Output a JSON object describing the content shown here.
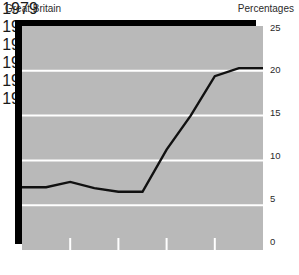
{
  "header": {
    "region_label": "Great Britain",
    "units_label": "Percentages"
  },
  "colors": {
    "panel_background": "#b9b9b9",
    "shadow": "#000000",
    "gridline": "#ffffff",
    "series_line": "#111111",
    "text": "#2b2b2b",
    "page_background": "#ffffff"
  },
  "axes": {
    "y_ticks": [
      "0",
      "5",
      "10",
      "15",
      "20",
      "25"
    ],
    "x_ticks": [
      "1979",
      "1981",
      "1983",
      "1985",
      "1987",
      "1989"
    ]
  },
  "chart_data": {
    "type": "line",
    "title": "Great Britain",
    "subtitle": "",
    "xlabel": "",
    "ylabel": "Percentages",
    "xlim": [
      1979,
      1989
    ],
    "ylim": [
      0,
      25
    ],
    "grid": true,
    "grid_axis": "y",
    "grid_values": [
      5,
      10,
      15,
      20,
      25
    ],
    "legend": false,
    "legend_position": "none",
    "x": [
      1979,
      1980,
      1981,
      1982,
      1983,
      1984,
      1985,
      1986,
      1987,
      1988,
      1989
    ],
    "series": [
      {
        "name": "Percentage",
        "values": [
          7.0,
          7.0,
          7.6,
          6.9,
          6.5,
          6.5,
          11.2,
          15.0,
          19.4,
          20.3,
          20.3
        ]
      }
    ],
    "x_tick_values": [
      1979,
      1981,
      1983,
      1985,
      1987,
      1989
    ],
    "y_tick_values": [
      0,
      5,
      10,
      15,
      20,
      25
    ],
    "annotations": []
  }
}
